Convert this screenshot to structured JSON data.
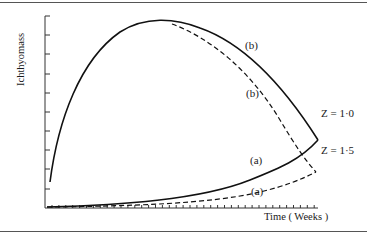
{
  "chart_data": {
    "type": "line",
    "title": "",
    "xlabel": "Time ( Weeks )",
    "ylabel": "Ichthyomass",
    "grid": false,
    "legend": "none (curve labels inline)",
    "x_ticks": "many unlabeled minor ticks",
    "y_ticks": "10 unlabeled ticks",
    "axis_ranges": {
      "x": [
        0,
        1
      ],
      "y": [
        0,
        1
      ]
    },
    "series": [
      {
        "name": "(b) Z = 1·0",
        "style": "solid",
        "description": "rises steeply from low start, peaks early, declines to meet (a) at Z = 1·0",
        "points": [
          [
            0.02,
            0.13
          ],
          [
            0.1,
            0.62
          ],
          [
            0.2,
            0.88
          ],
          [
            0.4,
            0.97
          ],
          [
            0.6,
            0.85
          ],
          [
            0.8,
            0.62
          ],
          [
            1.0,
            0.36
          ]
        ]
      },
      {
        "name": "(b) Z = 1·5",
        "style": "dashed",
        "description": "branches from (b) solid near peak and declines faster to Z = 1·5",
        "points": [
          [
            0.46,
            0.96
          ],
          [
            0.6,
            0.78
          ],
          [
            0.8,
            0.48
          ],
          [
            0.99,
            0.19
          ]
        ]
      },
      {
        "name": "(a) Z = 1·0",
        "style": "solid",
        "description": "starts near zero, rises slowly then sharply toward Z = 1·0",
        "points": [
          [
            0.0,
            0.0
          ],
          [
            0.3,
            0.03
          ],
          [
            0.6,
            0.09
          ],
          [
            0.8,
            0.18
          ],
          [
            1.0,
            0.36
          ]
        ]
      },
      {
        "name": "(a) Z = 1·5",
        "style": "dashed",
        "description": "starts near zero, rises slowly toward Z = 1·5",
        "points": [
          [
            0.0,
            0.0
          ],
          [
            0.3,
            0.02
          ],
          [
            0.6,
            0.06
          ],
          [
            0.8,
            0.11
          ],
          [
            0.99,
            0.19
          ]
        ]
      }
    ],
    "annotations": [
      "(b)",
      "(b)",
      "(a)",
      "(a)",
      "Z = 1·0",
      "Z = 1·5"
    ]
  },
  "labels": {
    "ylabel": "Ichthyomass",
    "xlabel": "Time ( Weeks )",
    "b_solid": "(b)",
    "b_dashed": "(b)",
    "a_solid": "(a)",
    "a_dashed": "(a)",
    "z10": "Z = 1·0",
    "z15": "Z = 1·5"
  }
}
